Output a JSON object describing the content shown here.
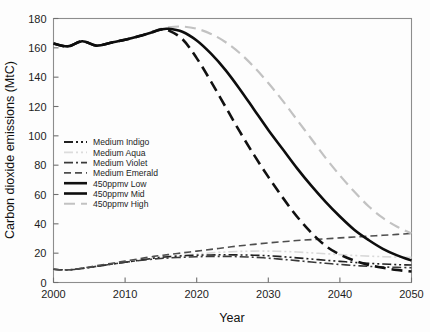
{
  "chart_data": {
    "type": "line",
    "title": "",
    "xlabel": "Year",
    "ylabel": "Carbon dioxide emissions (MtC)",
    "xlim": [
      2000,
      2050
    ],
    "ylim": [
      0,
      180
    ],
    "xticks": [
      2000,
      2010,
      2020,
      2030,
      2040,
      2050
    ],
    "yticks": [
      0,
      20,
      40,
      60,
      80,
      100,
      120,
      140,
      160,
      180
    ],
    "grid": false,
    "legend_position": "center-left",
    "x": [
      2000,
      2002,
      2004,
      2006,
      2008,
      2010,
      2012,
      2014,
      2015,
      2016,
      2018,
      2020,
      2022,
      2024,
      2026,
      2028,
      2030,
      2032,
      2034,
      2036,
      2038,
      2040,
      2042,
      2044,
      2046,
      2048,
      2050
    ],
    "series": [
      {
        "name": "Medium Indigo",
        "color": "#202020",
        "dash": "dash-dot-dot",
        "width": 1.6,
        "values": [
          9.0,
          8.6,
          9.6,
          11.0,
          12.4,
          13.8,
          15.2,
          16.6,
          17.2,
          17.6,
          18.2,
          18.6,
          18.8,
          18.9,
          18.8,
          18.6,
          18.2,
          17.6,
          16.8,
          16.0,
          15.2,
          14.4,
          13.7,
          13.1,
          12.6,
          12.2,
          11.9
        ]
      },
      {
        "name": "Medium Aqua",
        "color": "#d9d9d9",
        "dash": "dash-dot-dot",
        "width": 1.6,
        "values": [
          9.0,
          8.6,
          9.6,
          11.0,
          12.4,
          13.8,
          15.2,
          16.6,
          17.2,
          17.8,
          18.6,
          19.4,
          20.2,
          20.8,
          21.2,
          21.4,
          21.4,
          21.2,
          20.8,
          20.2,
          19.6,
          19.0,
          18.4,
          18.0,
          17.6,
          17.3,
          17.1
        ]
      },
      {
        "name": "Medium Violet",
        "color": "#3a3a3a",
        "dash": "dash-dot",
        "width": 1.6,
        "values": [
          9.0,
          8.6,
          9.6,
          11.0,
          12.4,
          13.8,
          15.0,
          16.0,
          16.4,
          16.7,
          17.2,
          17.6,
          17.8,
          17.8,
          17.6,
          17.2,
          16.6,
          15.8,
          14.9,
          14.0,
          13.1,
          12.3,
          11.6,
          11.0,
          10.6,
          10.3,
          10.1
        ]
      },
      {
        "name": "Medium Emerald",
        "color": "#4e4e4e",
        "dash": "dash",
        "width": 1.6,
        "values": [
          9.0,
          8.6,
          9.8,
          11.4,
          13.0,
          14.6,
          16.2,
          17.8,
          18.4,
          19.0,
          20.2,
          21.4,
          22.6,
          23.8,
          25.0,
          26.0,
          27.0,
          27.8,
          28.6,
          29.2,
          29.8,
          30.4,
          31.0,
          31.6,
          32.2,
          32.8,
          33.4
        ]
      },
      {
        "name": "450ppmv Low",
        "color": "#111111",
        "dash": "long-dash",
        "width": 2.6,
        "values": [
          163.0,
          161.0,
          164.5,
          161.5,
          163.5,
          165.5,
          168.0,
          171.0,
          172.5,
          172.0,
          166.0,
          153.0,
          137.0,
          120.0,
          103.0,
          87.0,
          72.0,
          58.0,
          45.0,
          34.0,
          25.0,
          19.0,
          15.0,
          12.0,
          10.0,
          8.5,
          7.5
        ]
      },
      {
        "name": "450ppmv Mid",
        "color": "#0d0d0d",
        "dash": "solid",
        "width": 2.6,
        "values": [
          163.0,
          161.0,
          164.5,
          161.5,
          163.5,
          165.5,
          168.0,
          171.0,
          172.5,
          173.0,
          171.0,
          165.0,
          156.0,
          145.0,
          132.0,
          118.0,
          104.0,
          91.0,
          78.0,
          66.0,
          55.0,
          45.0,
          36.0,
          29.0,
          23.0,
          18.5,
          15.0
        ]
      },
      {
        "name": "450ppmv High",
        "color": "#c2c2c2",
        "dash": "long-dash",
        "width": 2.2,
        "values": [
          163.0,
          161.0,
          164.5,
          161.5,
          163.5,
          165.5,
          168.0,
          171.5,
          173.0,
          174.0,
          174.5,
          173.0,
          169.5,
          164.0,
          156.5,
          147.0,
          136.0,
          124.0,
          111.0,
          98.0,
          85.0,
          73.0,
          62.0,
          52.0,
          44.0,
          38.0,
          33.5
        ]
      }
    ],
    "legend": [
      {
        "label": "Medium Indigo",
        "color": "#202020",
        "dash": "dash-dot-dot",
        "width": 1.8
      },
      {
        "label": "Medium Aqua",
        "color": "#dcdcdc",
        "dash": "dash-dot-dot",
        "width": 1.8
      },
      {
        "label": "Medium Violet",
        "color": "#3a3a3a",
        "dash": "dash-dot",
        "width": 1.8
      },
      {
        "label": "Medium Emerald",
        "color": "#4e4e4e",
        "dash": "dash",
        "width": 1.8
      },
      {
        "label": "450ppmv Low",
        "color": "#111111",
        "dash": "solid",
        "width": 2.6
      },
      {
        "label": "450ppmv Mid",
        "color": "#0d0d0d",
        "dash": "solid",
        "width": 2.6
      },
      {
        "label": "450ppmv High",
        "color": "#c2c2c2",
        "dash": "long-dash",
        "width": 2.0
      }
    ]
  }
}
